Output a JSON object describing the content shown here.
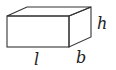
{
  "diagram": {
    "shape": "rectangular box (cuboid)",
    "labels": {
      "length": "l",
      "breadth": "b",
      "height": "h"
    },
    "stroke_color": "#333333"
  }
}
